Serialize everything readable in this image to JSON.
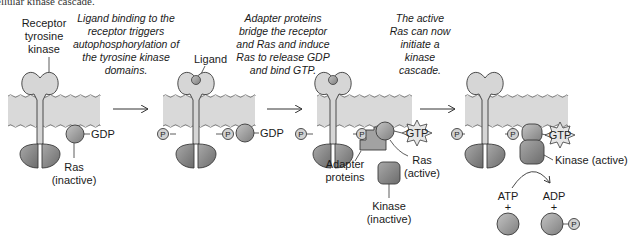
{
  "figure": {
    "top_cutoff_text": "ellular kinase cascade.",
    "colors": {
      "membrane": "#d9d9d9",
      "receptor_extracellular": "#d4d4d4",
      "kinase_domain": "#8a8a8a",
      "ras": "#9a9a9a",
      "phosphate": "#cfcfcf",
      "gtp_star": "#e4e4e4",
      "outline": "#3a3a3a"
    }
  },
  "panels": [
    {
      "id": "panel-1",
      "labels": {
        "receptor_line1": "Receptor",
        "receptor_line2": "tyrosine",
        "receptor_line3": "kinase",
        "gdp": "GDP",
        "ras_line1": "Ras",
        "ras_line2": "(inactive)"
      }
    },
    {
      "id": "panel-2",
      "caption": [
        "Ligand binding to the",
        "receptor triggers",
        "autophosphorylation of",
        "the tyrosine kinase",
        "domains."
      ],
      "labels": {
        "ligand": "Ligand",
        "gdp": "GDP",
        "p": "P"
      }
    },
    {
      "id": "panel-3",
      "caption": [
        "Adapter proteins",
        "bridge the receptor",
        "and Ras and induce",
        "Ras to release GDP",
        "and bind GTP."
      ],
      "labels": {
        "gtp": "GTP",
        "adapter_line1": "Adapter",
        "adapter_line2": "proteins",
        "ras_line1": "Ras",
        "ras_line2": "(active)",
        "kinase_line1": "Kinase",
        "kinase_line2": "(inactive)",
        "p": "P"
      }
    },
    {
      "id": "panel-4",
      "caption": [
        "The active",
        "Ras can now",
        "initiate a",
        "kinase",
        "cascade."
      ],
      "labels": {
        "gtp": "GTP",
        "kinase_active": "Kinase (active)",
        "atp": "ATP",
        "adp": "ADP",
        "plus": "+",
        "p": "P"
      }
    }
  ]
}
